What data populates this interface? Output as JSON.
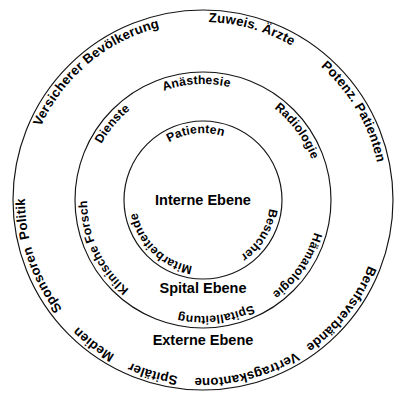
{
  "diagram": {
    "type": "concentric-circles",
    "center": {
      "x": 203,
      "y": 200
    },
    "colors": {
      "stroke": "#141414",
      "fill": "#ffffff",
      "text": "#000000"
    },
    "rings": [
      {
        "id": "externe-ebene",
        "level_label": "Externe Ebene",
        "radius": 190,
        "label_position": {
          "x": 203,
          "y": 345
        },
        "items": [
          {
            "label": "Bevölkerung",
            "angle": -62
          },
          {
            "label": "Zuweis. Ärzte",
            "angle": -20
          },
          {
            "label": "Potenz. Patienten",
            "angle": 22
          },
          {
            "label": "Berufsverbände",
            "angle": 66
          },
          {
            "label": "Vertragskantone",
            "angle": 110
          },
          {
            "label": "Spitäler",
            "angle": 143
          },
          {
            "label": "Medien",
            "angle": 168
          },
          {
            "label": "Sponsoren",
            "angle": 198
          },
          {
            "label": "Politik",
            "angle": 228
          },
          {
            "label": "Versicherer",
            "angle": 256
          },
          {
            "label": "",
            "angle": 0
          }
        ]
      },
      {
        "id": "spital-ebene",
        "level_label": "Spital Ebene",
        "radius": 128,
        "label_position": {
          "x": 203,
          "y": 293
        },
        "items": [
          {
            "label": "Anästhesie",
            "angle": -76
          },
          {
            "label": "Radiologie",
            "angle": -20
          },
          {
            "label": "Hämatologie",
            "angle": 32
          },
          {
            "label": "Spitalleitung",
            "angle": 96
          },
          {
            "label": "Klinische Forschung",
            "angle": 200
          },
          {
            "label": "Dienste",
            "angle": 250
          }
        ]
      },
      {
        "id": "interne-ebene",
        "level_label": "Interne Ebene",
        "radius": 79,
        "label_position": {
          "x": 203,
          "y": 205
        },
        "items": [
          {
            "label": "Patienten",
            "angle": -90
          },
          {
            "label": "Besucher",
            "angle": 12
          },
          {
            "label": "Mitarbeitende",
            "angle": 160
          }
        ]
      }
    ]
  }
}
